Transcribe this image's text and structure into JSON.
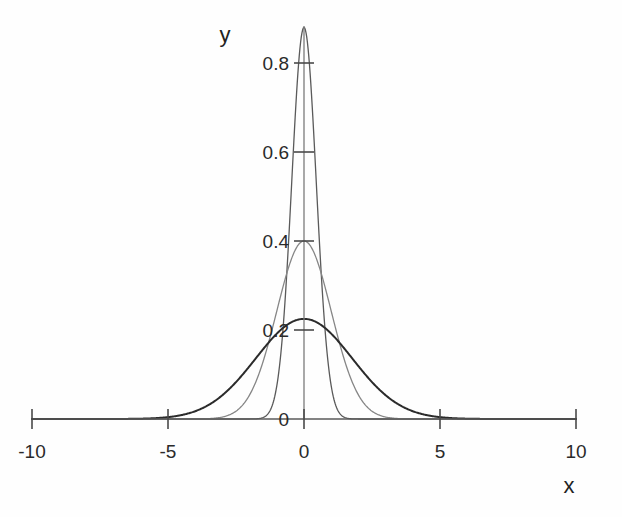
{
  "chart_data": {
    "type": "line",
    "title": "",
    "xlabel": "x",
    "ylabel": "y",
    "xlim": [
      -10,
      10
    ],
    "ylim": [
      0,
      0.95
    ],
    "grid": false,
    "legend": "none",
    "x_ticks": [
      -10,
      -5,
      0,
      5,
      10
    ],
    "x_tick_labels": [
      "-10",
      "-5",
      "0",
      "5",
      "10"
    ],
    "y_ticks": [
      0,
      0.2,
      0.4,
      0.6,
      0.8
    ],
    "y_tick_labels": [
      "0",
      "0.2",
      "0.4",
      "0.6",
      "0.8"
    ],
    "series": [
      {
        "name": "narrow-gaussian",
        "peak": 0.88,
        "mean": 0,
        "sigma": 0.45,
        "color": "#5a5a5a",
        "x": [
          -10,
          -9,
          -8,
          -7,
          -6,
          -5,
          -4,
          -3,
          -2.5,
          -2,
          -1.75,
          -1.5,
          -1.25,
          -1,
          -0.75,
          -0.5,
          -0.25,
          0,
          0.25,
          0.5,
          0.75,
          1,
          1.25,
          1.5,
          1.75,
          2,
          2.5,
          3,
          4,
          5,
          6,
          7,
          8,
          9,
          10
        ],
        "values": [
          0,
          0,
          0,
          0,
          0,
          0,
          0,
          0.0001,
          0.0007,
          0.0054,
          0.0136,
          0.0311,
          0.0645,
          0.1208,
          0.2052,
          0.3162,
          0.4428,
          0.88,
          0.4428,
          0.3162,
          0.2052,
          0.1208,
          0.0645,
          0.0311,
          0.0136,
          0.0054,
          0.0007,
          0.0001,
          0,
          0,
          0,
          0,
          0,
          0,
          0
        ]
      },
      {
        "name": "medium-gaussian",
        "peak": 0.4,
        "mean": 0,
        "sigma": 1.0,
        "color": "#868686",
        "x": [
          -10,
          -8,
          -6,
          -5,
          -4,
          -3.5,
          -3,
          -2.5,
          -2,
          -1.5,
          -1,
          -0.5,
          0,
          0.5,
          1,
          1.5,
          2,
          2.5,
          3,
          3.5,
          4,
          5,
          6,
          8,
          10
        ],
        "values": [
          0,
          0,
          0,
          0.0,
          0.0001,
          0.0009,
          0.0044,
          0.0175,
          0.054,
          0.1295,
          0.242,
          0.3521,
          0.4,
          0.3521,
          0.242,
          0.1295,
          0.054,
          0.0175,
          0.0044,
          0.0009,
          0.0001,
          0.0,
          0,
          0,
          0
        ]
      },
      {
        "name": "wide-gaussian",
        "peak": 0.225,
        "mean": 0,
        "sigma": 1.77,
        "color": "#2b2b2b",
        "x": [
          -10,
          -8,
          -7,
          -6,
          -5.5,
          -5,
          -4.5,
          -4,
          -3.5,
          -3,
          -2.5,
          -2,
          -1.5,
          -1,
          -0.5,
          0,
          0.5,
          1,
          1.5,
          2,
          2.5,
          3,
          3.5,
          4,
          4.5,
          5,
          5.5,
          6,
          7,
          8,
          10
        ],
        "values": [
          0,
          0.0001,
          0.0004,
          0.0019,
          0.0042,
          0.0085,
          0.0161,
          0.0285,
          0.0472,
          0.0735,
          0.1073,
          0.1471,
          0.1893,
          0.2288,
          0.26,
          0.225,
          0.26,
          0.2288,
          0.1893,
          0.1471,
          0.1073,
          0.0735,
          0.0472,
          0.0285,
          0.0161,
          0.0085,
          0.0042,
          0.0019,
          0.0004,
          0.0001,
          0
        ]
      }
    ]
  },
  "axes": {
    "x_axis_label": "x",
    "y_axis_label": "y"
  }
}
